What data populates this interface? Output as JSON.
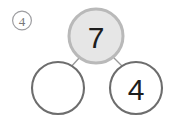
{
  "item": {
    "number_label": "4",
    "number_label_style": "circled"
  },
  "diagram": {
    "type": "number-bond",
    "whole": {
      "value": "7",
      "filled": true,
      "fill_color": "#e6e6e6",
      "ring_color": "#b9b9b9",
      "text_color": "#1d1d1d"
    },
    "parts": [
      {
        "value": "",
        "filled": false,
        "fill_color": "#ffffff",
        "ring_color": "#6d6d6d",
        "text_color": "#1d1d1d",
        "position": "left",
        "blank": true
      },
      {
        "value": "4",
        "filled": false,
        "fill_color": "#ffffff",
        "ring_color": "#6d6d6d",
        "text_color": "#1d1d1d",
        "position": "right",
        "blank": false
      }
    ],
    "connector_color": "#9a9a9a"
  },
  "colors": {
    "background": "#ffffff",
    "whole_fill": "#e6e6e6",
    "whole_ring": "#b9b9b9",
    "part_ring": "#6d6d6d",
    "connector": "#9a9a9a",
    "item_label": "#77777a",
    "digit": "#1d1d1d"
  }
}
